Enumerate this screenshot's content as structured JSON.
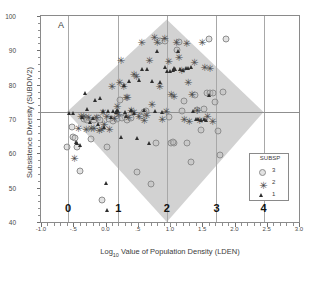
{
  "panel": {
    "label": "A"
  },
  "axes": {
    "x": {
      "title_pre": "Log",
      "title_sub": "10",
      "title_post": " Value of Population Density (LDEN)",
      "min": -1.0,
      "max": 3.0,
      "ticks": [
        "-1.0",
        "-.5",
        "0.0",
        ".5",
        "1.0",
        "1.5",
        "2.0",
        "2.5",
        "3.0"
      ],
      "tick_values": [
        -1.0,
        -0.5,
        0.0,
        0.5,
        1.0,
        1.5,
        2.0,
        2.5,
        3.0
      ]
    },
    "y": {
      "title": "Subsistence Diversity (SUBDIV2)",
      "min": 40,
      "max": 100,
      "ticks": [
        "40",
        "50",
        "60",
        "70",
        "80",
        "90",
        "100"
      ],
      "tick_values": [
        40,
        50,
        60,
        70,
        80,
        90,
        100
      ]
    }
  },
  "reference_line": {
    "y": 72
  },
  "group_markers": {
    "labels": [
      "0",
      "1",
      "2",
      "3",
      "4"
    ],
    "x_values": [
      -0.58,
      0.2,
      0.95,
      1.72,
      2.45
    ],
    "label_y": 43.5
  },
  "hull": {
    "name": "confidence-diamond",
    "color": "#d2d2d2",
    "vertices": [
      [
        -0.6,
        72
      ],
      [
        0.95,
        99
      ],
      [
        2.45,
        72
      ],
      [
        0.95,
        40
      ]
    ]
  },
  "legend": {
    "title": "SUBSP",
    "items": [
      {
        "label": "3",
        "marker": "circle"
      },
      {
        "label": "2",
        "marker": "asterisk"
      },
      {
        "label": "1",
        "marker": "triangle"
      }
    ]
  },
  "chart_data": {
    "type": "scatter",
    "title": "A",
    "xlabel": "Log10 Value of Population Density (LDEN)",
    "ylabel": "Subsistence Diversity (SUBDIV2)",
    "xlim": [
      -1.0,
      3.0
    ],
    "ylim": [
      40,
      100
    ],
    "grid": "vertical-group-lines",
    "legend_position": "bottom-right",
    "legend_title": "SUBSP",
    "series": [
      {
        "name": "3",
        "marker": "circle",
        "color": "#8e8e8e",
        "points": [
          [
            -0.6,
            61.8
          ],
          [
            -0.52,
            67.6
          ],
          [
            -0.5,
            64.8
          ],
          [
            -0.47,
            64.6
          ],
          [
            -0.44,
            62.0
          ],
          [
            -0.4,
            54.8
          ],
          [
            -0.34,
            70.0
          ],
          [
            -0.3,
            70.3
          ],
          [
            -0.22,
            64.1
          ],
          [
            -0.18,
            69.7
          ],
          [
            -0.12,
            70.2
          ],
          [
            -0.08,
            69.8
          ],
          [
            -0.05,
            46.3
          ],
          [
            0.02,
            61.8
          ],
          [
            0.06,
            70.1
          ],
          [
            0.12,
            69.4
          ],
          [
            0.18,
            70.0
          ],
          [
            0.22,
            75.5
          ],
          [
            0.3,
            70.6
          ],
          [
            0.34,
            69.8
          ],
          [
            0.4,
            70.3
          ],
          [
            0.48,
            54.7
          ],
          [
            0.55,
            71.0
          ],
          [
            0.62,
            72.4
          ],
          [
            0.7,
            51.0
          ],
          [
            0.78,
            63.0
          ],
          [
            0.85,
            92.6
          ],
          [
            0.92,
            92.8
          ],
          [
            0.98,
            70.5
          ],
          [
            1.02,
            63.1
          ],
          [
            1.06,
            63.0
          ],
          [
            1.1,
            90.1
          ],
          [
            1.14,
            92.4
          ],
          [
            1.18,
            72.3
          ],
          [
            1.22,
            75.2
          ],
          [
            1.26,
            63.1
          ],
          [
            1.32,
            57.6
          ],
          [
            1.38,
            77.0
          ],
          [
            1.42,
            72.6
          ],
          [
            1.48,
            66.8
          ],
          [
            1.52,
            72.8
          ],
          [
            1.58,
            77.5
          ],
          [
            1.62,
            77.6
          ],
          [
            1.66,
            77.7
          ],
          [
            1.7,
            75.0
          ],
          [
            1.74,
            66.6
          ],
          [
            1.78,
            59.6
          ],
          [
            1.82,
            77.8
          ],
          [
            1.86,
            93.4
          ],
          [
            1.6,
            93.2
          ],
          [
            1.05,
            63.2
          ],
          [
            0.6,
            72.0
          ],
          [
            0.26,
            70.4
          ],
          [
            -0.28,
            69.6
          ]
        ]
      },
      {
        "name": "2",
        "marker": "asterisk",
        "color": "#4a4a4a",
        "points": [
          [
            -0.48,
            58.6
          ],
          [
            -0.42,
            67.3
          ],
          [
            -0.38,
            70.8
          ],
          [
            -0.34,
            71.0
          ],
          [
            -0.3,
            67.2
          ],
          [
            -0.26,
            70.5
          ],
          [
            -0.22,
            67.4
          ],
          [
            -0.18,
            67.5
          ],
          [
            -0.14,
            70.7
          ],
          [
            -0.1,
            66.9
          ],
          [
            -0.06,
            67.1
          ],
          [
            -0.02,
            68.6
          ],
          [
            0.02,
            70.9
          ],
          [
            0.06,
            67.0
          ],
          [
            0.1,
            79.6
          ],
          [
            0.14,
            70.2
          ],
          [
            0.18,
            73.9
          ],
          [
            0.22,
            80.8
          ],
          [
            0.24,
            87.2
          ],
          [
            0.28,
            79.7
          ],
          [
            0.32,
            76.4
          ],
          [
            0.36,
            70.6
          ],
          [
            0.4,
            72.5
          ],
          [
            0.44,
            83.2
          ],
          [
            0.48,
            82.4
          ],
          [
            0.52,
            71.0
          ],
          [
            0.56,
            92.3
          ],
          [
            0.6,
            69.7
          ],
          [
            0.64,
            71.2
          ],
          [
            0.68,
            87.3
          ],
          [
            0.72,
            74.5
          ],
          [
            0.76,
            93.8
          ],
          [
            0.8,
            92.3
          ],
          [
            0.84,
            79.5
          ],
          [
            0.88,
            70.1
          ],
          [
            0.92,
            93.6
          ],
          [
            0.94,
            72.3
          ],
          [
            0.98,
            86.9
          ],
          [
            1.02,
            77.3
          ],
          [
            1.06,
            76.8
          ],
          [
            1.1,
            92.3
          ],
          [
            1.14,
            88.0
          ],
          [
            1.18,
            84.2
          ],
          [
            1.22,
            70.0
          ],
          [
            1.26,
            92.1
          ],
          [
            1.3,
            69.5
          ],
          [
            1.34,
            77.4
          ],
          [
            1.38,
            86.7
          ],
          [
            1.42,
            72.5
          ],
          [
            1.46,
            69.6
          ],
          [
            1.5,
            92.4
          ],
          [
            1.54,
            85.2
          ],
          [
            1.58,
            71.0
          ],
          [
            1.62,
            85.0
          ],
          [
            1.66,
            69.4
          ],
          [
            1.28,
            80.8
          ],
          [
            0.34,
            76.5
          ],
          [
            0.2,
            71.5
          ],
          [
            -0.04,
            72.1
          ],
          [
            0.44,
            72.0
          ]
        ]
      },
      {
        "name": "1",
        "marker": "triangle",
        "color": "#2e2e2e",
        "points": [
          [
            -0.56,
            71.7
          ],
          [
            -0.5,
            71.8
          ],
          [
            -0.46,
            63.4
          ],
          [
            -0.44,
            63.0
          ],
          [
            -0.4,
            62.3
          ],
          [
            -0.36,
            70.6
          ],
          [
            -0.32,
            77.7
          ],
          [
            -0.28,
            73.0
          ],
          [
            -0.24,
            69.0
          ],
          [
            -0.2,
            70.2
          ],
          [
            -0.16,
            75.5
          ],
          [
            -0.12,
            68.7
          ],
          [
            -0.08,
            76.2
          ],
          [
            -0.04,
            72.3
          ],
          [
            0.0,
            51.5
          ],
          [
            0.04,
            72.4
          ],
          [
            0.08,
            70.5
          ],
          [
            0.12,
            72.2
          ],
          [
            0.16,
            72.0
          ],
          [
            0.2,
            72.3
          ],
          [
            0.24,
            64.7
          ],
          [
            0.28,
            79.9
          ],
          [
            0.32,
            71.0
          ],
          [
            0.36,
            81.0
          ],
          [
            0.4,
            72.6
          ],
          [
            0.44,
            71.8
          ],
          [
            0.48,
            64.6
          ],
          [
            0.52,
            81.3
          ],
          [
            0.56,
            84.6
          ],
          [
            0.6,
            72.5
          ],
          [
            0.64,
            84.6
          ],
          [
            0.68,
            62.9
          ],
          [
            0.72,
            81.1
          ],
          [
            0.76,
            72.4
          ],
          [
            0.8,
            89.9
          ],
          [
            0.84,
            80.9
          ],
          [
            0.88,
            72.1
          ],
          [
            0.92,
            85.2
          ],
          [
            0.96,
            84.0
          ],
          [
            1.0,
            83.9
          ],
          [
            1.04,
            84.3
          ],
          [
            1.08,
            84.5
          ],
          [
            1.12,
            89.8
          ],
          [
            1.16,
            84.7
          ],
          [
            1.2,
            84.4
          ],
          [
            1.24,
            84.8
          ],
          [
            1.28,
            84.9
          ],
          [
            1.32,
            85.1
          ],
          [
            1.36,
            72.2
          ],
          [
            1.4,
            69.9
          ],
          [
            1.44,
            70.0
          ],
          [
            1.48,
            69.8
          ],
          [
            1.52,
            70.1
          ],
          [
            1.56,
            69.7
          ],
          [
            1.6,
            77.1
          ],
          [
            0.02,
            43.6
          ],
          [
            -0.02,
            67.8
          ],
          [
            0.3,
            72.1
          ],
          [
            0.18,
            72.5
          ],
          [
            1.06,
            85.0
          ]
        ]
      }
    ]
  }
}
